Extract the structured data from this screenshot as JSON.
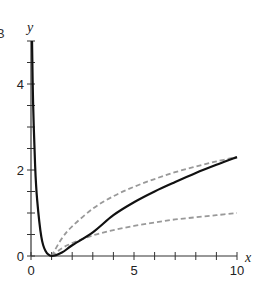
{
  "chart_data": {
    "type": "line",
    "title": "",
    "panel_label": "B",
    "xlabel": "x",
    "ylabel": "y",
    "xlim": [
      0,
      10
    ],
    "ylim": [
      0,
      5
    ],
    "xticks": [
      0,
      1,
      2,
      3,
      4,
      5,
      6,
      7,
      8,
      9,
      10
    ],
    "xtick_labels": [
      "0",
      "5",
      "10"
    ],
    "xtick_label_values": [
      0,
      5,
      10
    ],
    "yticks": [
      0,
      0.5,
      1,
      1.5,
      2,
      2.5,
      3,
      3.5,
      4,
      4.5,
      5
    ],
    "ytick_labels": [
      "0",
      "2",
      "4"
    ],
    "ytick_label_values": [
      0,
      2,
      4
    ],
    "grid": false,
    "legend": null,
    "series": [
      {
        "name": "solid curve",
        "style": "solid",
        "color": "#111111",
        "x": [
          0.05,
          0.1,
          0.2,
          0.3,
          0.5,
          0.7,
          1,
          1.5,
          2,
          3,
          4,
          5,
          6,
          7,
          8,
          9,
          10
        ],
        "y": [
          5,
          3.6,
          2.1,
          1.3,
          0.45,
          0.12,
          0,
          0.08,
          0.25,
          0.55,
          0.95,
          1.25,
          1.5,
          1.72,
          1.93,
          2.12,
          2.3
        ]
      },
      {
        "name": "upper dashed curve",
        "style": "dashed",
        "color": "#999999",
        "x": [
          1,
          1.5,
          2,
          3,
          4,
          5,
          6,
          7,
          8,
          9,
          10
        ],
        "y": [
          0,
          0.41,
          0.69,
          1.1,
          1.39,
          1.61,
          1.79,
          1.95,
          2.08,
          2.2,
          2.3
        ]
      },
      {
        "name": "lower dashed curve",
        "style": "dashed",
        "color": "#999999",
        "x": [
          1,
          1.5,
          2,
          3,
          4,
          5,
          6,
          7,
          8,
          9,
          10
        ],
        "y": [
          0,
          0.18,
          0.3,
          0.48,
          0.6,
          0.7,
          0.78,
          0.85,
          0.9,
          0.95,
          1.0
        ]
      }
    ]
  }
}
